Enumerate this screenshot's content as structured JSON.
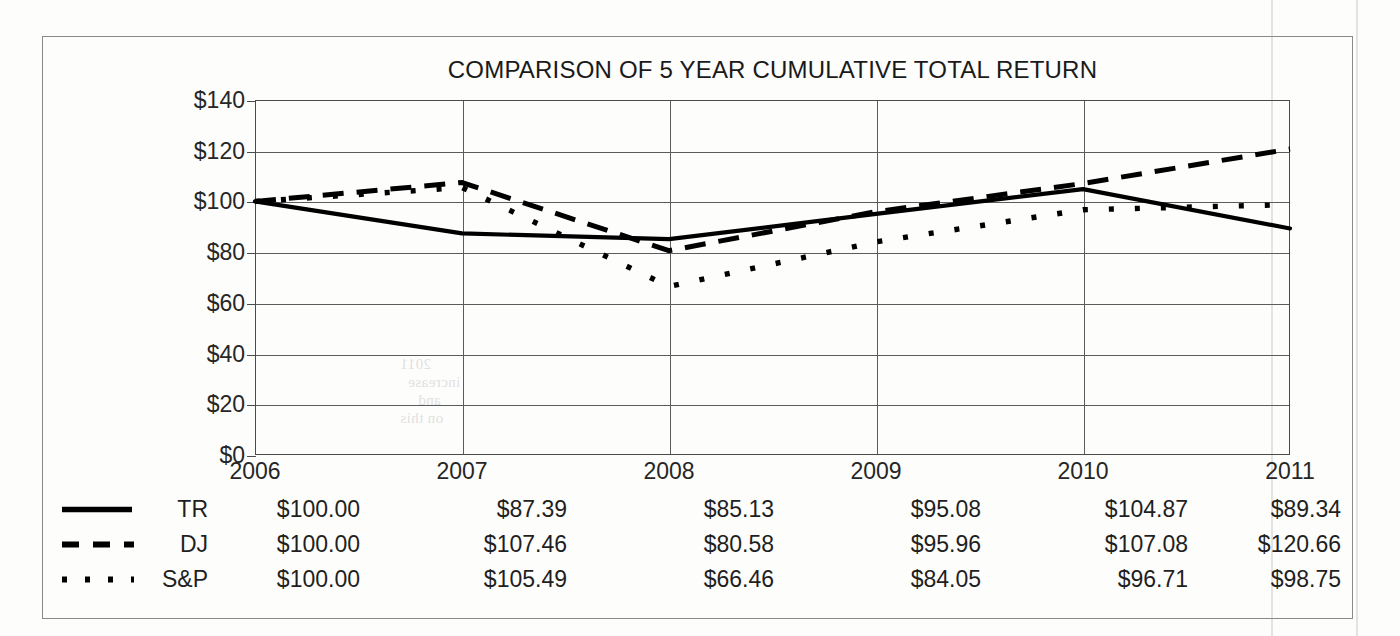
{
  "chart_data": {
    "type": "line",
    "title": "COMPARISON OF 5 YEAR CUMULATIVE TOTAL RETURN",
    "xlabel": "",
    "ylabel": "",
    "categories": [
      "2006",
      "2007",
      "2008",
      "2009",
      "2010",
      "2011"
    ],
    "ylim": [
      0,
      140
    ],
    "yticks": [
      0,
      20,
      40,
      60,
      80,
      100,
      120,
      140
    ],
    "ytick_labels": [
      "$0",
      "$20",
      "$40",
      "$60",
      "$80",
      "$100",
      "$120",
      "$140"
    ],
    "grid": true,
    "legend_position": "bottom-left",
    "series": [
      {
        "name": "TR",
        "style": "solid",
        "color": "#000000",
        "values": [
          100.0,
          87.39,
          85.13,
          95.08,
          104.87,
          89.34
        ],
        "labels": [
          "$100.00",
          "$87.39",
          "$85.13",
          "$95.08",
          "$104.87",
          "$89.34"
        ]
      },
      {
        "name": "DJ",
        "style": "dashed",
        "color": "#000000",
        "values": [
          100.0,
          107.46,
          80.58,
          95.96,
          107.08,
          120.66
        ],
        "labels": [
          "$100.00",
          "$107.46",
          "$80.58",
          "$95.96",
          "$107.08",
          "$120.66"
        ]
      },
      {
        "name": "S&P",
        "style": "dotted",
        "color": "#000000",
        "values": [
          100.0,
          105.49,
          66.46,
          84.05,
          96.71,
          98.75
        ],
        "labels": [
          "$100.00",
          "$105.49",
          "$66.46",
          "$84.05",
          "$96.71",
          "$98.75"
        ]
      }
    ]
  },
  "table": {
    "header": [
      "2006",
      "2007",
      "2008",
      "2009",
      "2010",
      "2011"
    ],
    "rows": [
      {
        "name": "TR",
        "cells": [
          "$100.00",
          "$87.39",
          "$85.13",
          "$95.08",
          "$104.87",
          "$89.34"
        ]
      },
      {
        "name": "DJ",
        "cells": [
          "$100.00",
          "$107.46",
          "$80.58",
          "$95.96",
          "$107.08",
          "$120.66"
        ]
      },
      {
        "name": "S&P",
        "cells": [
          "$100.00",
          "$105.49",
          "$66.46",
          "$84.05",
          "$96.71",
          "$98.75"
        ]
      }
    ]
  },
  "artifacts": {
    "bleed_text": [
      "2011",
      "increase",
      "and",
      "on this",
      "per"
    ]
  }
}
